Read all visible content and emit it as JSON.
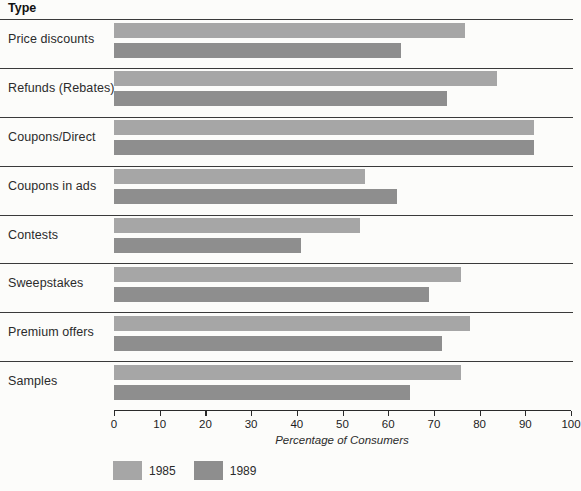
{
  "header": {
    "title": "Type"
  },
  "chart_data": {
    "type": "bar",
    "orientation": "horizontal",
    "title": "",
    "ylabel_header": "Type",
    "xlabel": "Percentage of Consumers",
    "xlim": [
      0,
      100
    ],
    "xticks": [
      0,
      10,
      20,
      30,
      40,
      50,
      60,
      70,
      80,
      90,
      100
    ],
    "grid": false,
    "legend_position": "bottom-left",
    "categories": [
      "Price discounts",
      "Refunds (Rebates)",
      "Coupons/Direct",
      "Coupons in ads",
      "Contests",
      "Sweepstakes",
      "Premium offers",
      "Samples"
    ],
    "series": [
      {
        "name": "1985",
        "color": "#a6a6a6",
        "values": [
          77,
          84,
          92,
          55,
          54,
          76,
          78,
          76
        ]
      },
      {
        "name": "1989",
        "color": "#8e8e8e",
        "values": [
          63,
          73,
          92,
          62,
          41,
          69,
          72,
          65
        ]
      }
    ],
    "colors": {
      "bar_1985": "#a6a6a6",
      "bar_1989": "#8e8e8e",
      "line": "#3a3a3a",
      "background": "#fcfcfa"
    }
  }
}
